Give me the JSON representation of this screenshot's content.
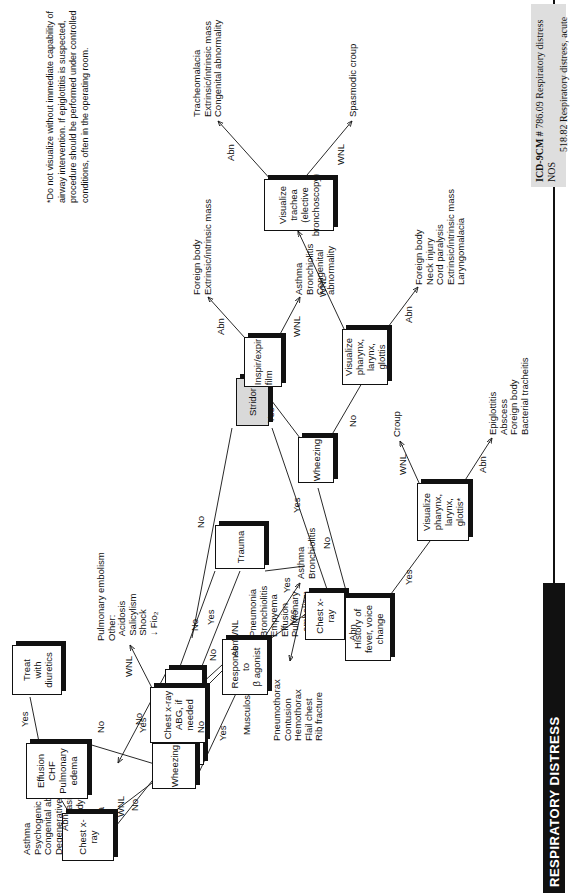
{
  "page": {
    "spine_title": "RESPIRATORY DISTRESS",
    "icd_label": "ICD-9CM #",
    "icd_line1": "786.09 Respiratory distress NOS",
    "icd_line2": "518.82 Respiratory distress, acute",
    "footnote": "*Do not visualize without immediate capability of airway intervention. If epiglottitis is suspected, procedure should be performed under controlled conditions, often in the operating room."
  },
  "nodes": {
    "stridor": "Stridor",
    "acute_onset": "Acute onset",
    "trauma": "Trauma",
    "chest_xray_trauma": "Chest x-ray",
    "heart_liver_renal": "Heart, liver,\nrenal disease",
    "wheezing_upper": "Wheezing",
    "chest_xray_upper": "Chest x-ray",
    "effusion_chf": "Effusion\nCHF\nPulmonary\nedema",
    "treat_diuretics": "Treat\nwith\ndiuretics",
    "chest_xray_abg": "Chest x-ray\nABG, if needed",
    "response_beta": "Response to\nβ agonist",
    "history_fever": "History of fever, voice change",
    "visualize_star": "Visualize pharynx,\nlarynx, glottis*",
    "wheezing_lower": "Wheezing",
    "inspir_expir": "Inspir/expir\nfilm",
    "visualize_plain": "Visualize pharynx,\nlarynx, glottis",
    "visualize_trachea": "Visualize trachea\n(elective bronchoscopy)"
  },
  "edge_labels": {
    "stridor_yes": "Yes",
    "stridor_no": "No",
    "acute_no": "No",
    "acute_yes": "Yes",
    "trauma_yes": "Yes",
    "trauma_no": "No",
    "cxr_tr_abn": "Abn",
    "cxr_tr_wnl": "WNL",
    "hlr_yes": "Yes",
    "hlr_no": "No",
    "wheez_up_no": "No",
    "wheez_up_yes": "Yes",
    "cxr_up_abn": "Abn",
    "cxr_up_wnl": "WNL",
    "eff_yes": "Yes",
    "eff_no": "No",
    "cxrabg_wnl": "WNL",
    "cxrabg_abn": "Abn",
    "beta_no": "No",
    "beta_yes": "Yes",
    "hist_yes": "Yes",
    "hist_no": "No",
    "vis_star_wnl": "WNL",
    "vis_star_abn": "Abn",
    "wheez_low_yes": "Yes",
    "wheez_low_no": "No",
    "insp_abn": "Abn",
    "insp_wnl": "WNL",
    "vis_plain_wnl": "WNL",
    "vis_plain_abn": "Abn",
    "trachea_abn": "Abn",
    "trachea_wnl": "WNL"
  },
  "leaves": {
    "acute_no_list": "Asthma\nPsychogenic\nCongenital abnormality\nDegenerative, CF\nBronchiectasis\nForeign body\nCHF\nPneumonia",
    "cxr_trauma_abn": "Pneumothorax\nContusion\nHemothorax\nFlail chest\nRib fracture",
    "cxr_trauma_wnl": "Musculoskeletal",
    "cxrabg_wnl_list": "Pulmonary embolism\nOther:\n  Acidosis\n  Salicylism\n  Shock\n  ↓ Fio₂",
    "cxrabg_abn_list": "Pneumonia\nBronchiolitis\nEmpyema\nEffusion\nPulmonary\n  embolism\nPulmonary\n  edema",
    "beta_yes_list": "Asthma\nBronchiolitis",
    "vis_star_wnl_leaf": "Croup",
    "vis_star_abn_list": "Epiglottitis\nAbscess\nForeign body\nBacterial tracheitis",
    "insp_abn_list": "Foreign body\nExtrinsic/intrinsic mass",
    "insp_wnl_list": "Asthma\nBronchiolitis\nCongenital\nabnormality",
    "vis_plain_abn_list": "Foreign body\nNeck injury\nCord paralysis\nExtrinsic/intrinsic mass\nLaryngomalacia",
    "trachea_abn_list": "Tracheomalacia\nExtrinsic/intrinsic mass\nCongenital abnormality",
    "trachea_wnl_leaf": "Spasmodic croup"
  },
  "colors": {
    "ink": "#111111",
    "root_fill": "#d9d9d9",
    "icd_fill": "#dedede",
    "paper": "#ffffff"
  }
}
